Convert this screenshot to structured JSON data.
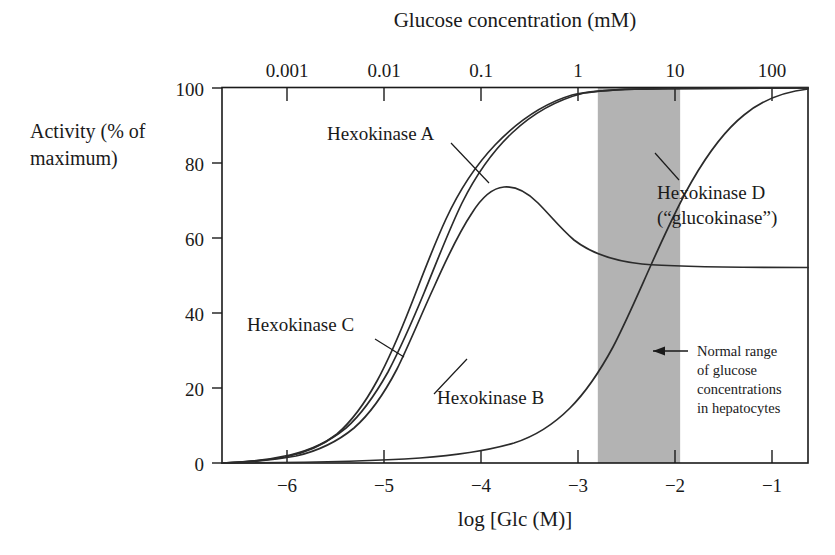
{
  "figure": {
    "background_color": "#ffffff",
    "ink_color": "#1a1a1a",
    "band_color": "#b3b3b3",
    "top_axis_title": "Glucose concentration (mM)",
    "bottom_axis_title": "log [Glc (M)]",
    "y_axis_title_line1": "Activity (% of",
    "y_axis_title_line2": "maximum)"
  },
  "curve_labels": {
    "a": "Hexokinase A",
    "b": "Hexokinase B",
    "c": "Hexokinase C",
    "d_line1": "Hexokinase D",
    "d_line2": "(“glucokinase”)"
  },
  "annotation": {
    "line1": "Normal range",
    "line2": "of glucose",
    "line3": "concentrations",
    "line4": "in hepatocytes",
    "arrow_glyph": "left-arrow"
  },
  "chart_data": {
    "type": "line",
    "title": "Glucose concentration (mM)",
    "subtitle": "",
    "xlabel": "log [Glc (M)]",
    "ylabel": "Activity (% of maximum)",
    "xlim": [
      -6.6,
      -0.55
    ],
    "ylim": [
      0,
      100
    ],
    "grid": false,
    "legend_position": "inline-labels",
    "x_ticks": [
      -6,
      -5,
      -4,
      -3,
      -2,
      -1
    ],
    "x_tick_labels": [
      "−6",
      "−5",
      "−4",
      "−3",
      "−2",
      "−1"
    ],
    "y_ticks": [
      0,
      20,
      40,
      60,
      80,
      100
    ],
    "y_tick_labels": [
      "0",
      "20",
      "40",
      "60",
      "80",
      "100"
    ],
    "secondary_x_axis": {
      "label": "Glucose concentration (mM)",
      "ticks": [
        -6,
        -5,
        -4,
        -3,
        -2,
        -1
      ],
      "tick_labels": [
        "0.001",
        "0.01",
        "0.1",
        "1",
        "10",
        "100"
      ]
    },
    "shaded_band": {
      "label": "Normal range of glucose concentrations in hepatocytes",
      "x_start": -2.72,
      "x_end": -1.87,
      "color": "#b3b3b3"
    },
    "series": [
      {
        "name": "Hexokinase A",
        "x": [
          -6.6,
          -6.2,
          -5.8,
          -5.5,
          -5.2,
          -5.0,
          -4.8,
          -4.6,
          -4.45,
          -4.3,
          -4.15,
          -4.0,
          -3.85,
          -3.7,
          -3.5,
          -3.3,
          -3.1,
          -2.9,
          -2.7,
          -2.5,
          -2.2,
          -1.8,
          -1.2,
          -0.55
        ],
        "y": [
          0,
          0.6,
          2.0,
          3.6,
          6.5,
          9.5,
          14.0,
          21.0,
          27.0,
          35.0,
          44.0,
          54.0,
          64.0,
          73.0,
          83.0,
          90.0,
          94.5,
          97.0,
          98.5,
          99.3,
          99.8,
          100,
          100,
          100
        ]
      },
      {
        "name": "Hexokinase B",
        "x": [
          -6.6,
          -6.2,
          -5.8,
          -5.5,
          -5.2,
          -5.0,
          -4.8,
          -4.65,
          -4.5,
          -4.35,
          -4.2,
          -4.05,
          -3.9,
          -3.75,
          -3.6,
          -3.4,
          -3.2,
          -3.0,
          -2.8,
          -2.55,
          -2.2,
          -1.8,
          -1.2,
          -0.55
        ],
        "y": [
          0,
          0.8,
          2.6,
          4.6,
          8.2,
          12.0,
          18.0,
          24.0,
          32.0,
          41.0,
          51.0,
          61.0,
          70.0,
          78.0,
          85.0,
          92.0,
          96.0,
          98.0,
          99.2,
          99.7,
          100,
          100,
          100,
          100
        ]
      },
      {
        "name": "Hexokinase C",
        "x": [
          -6.6,
          -6.2,
          -5.8,
          -5.5,
          -5.2,
          -5.0,
          -4.8,
          -4.6,
          -4.45,
          -4.3,
          -4.15,
          -4.0,
          -3.9,
          -3.8,
          -3.7,
          -3.6,
          -3.45,
          -3.3,
          -3.1,
          -2.9,
          -2.7,
          -2.5,
          -2.3,
          -2.1,
          -1.9,
          -1.6,
          -1.2,
          -0.8,
          -0.55
        ],
        "y": [
          0,
          0.5,
          1.6,
          3.0,
          5.5,
          8.5,
          14.0,
          22.0,
          31.0,
          43.0,
          56.0,
          66.0,
          70.5,
          72.8,
          73.2,
          72.5,
          70.0,
          66.5,
          62.0,
          58.0,
          55.0,
          53.2,
          52.0,
          51.3,
          50.9,
          50.5,
          50.2,
          50.1,
          50.0
        ]
      },
      {
        "name": "Hexokinase D (“glucokinase”)",
        "x": [
          -6.6,
          -5.5,
          -4.8,
          -4.4,
          -4.1,
          -3.85,
          -3.6,
          -3.4,
          -3.2,
          -3.0,
          -2.85,
          -2.7,
          -2.55,
          -2.4,
          -2.25,
          -2.1,
          -1.95,
          -1.8,
          -1.65,
          -1.5,
          -1.3,
          -1.1,
          -0.85,
          -0.55
        ],
        "y": [
          0,
          0.2,
          0.5,
          0.9,
          1.5,
          2.4,
          4.0,
          6.0,
          9.0,
          14.0,
          19.0,
          26.0,
          34.0,
          43.0,
          53.0,
          63.0,
          72.0,
          80.0,
          86.5,
          91.5,
          96.0,
          98.5,
          99.6,
          100
        ]
      }
    ]
  }
}
